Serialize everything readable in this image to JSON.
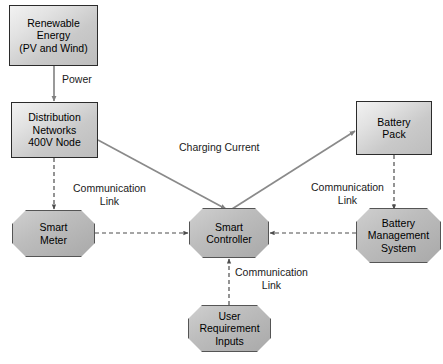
{
  "diagram": {
    "background_color": "#ffffff",
    "node_fill_rect": "#d9d9d9",
    "node_fill_octagon": "#b3b3b3",
    "line_color": "#808080",
    "dashed_line_color": "#555555",
    "nodes": [
      {
        "id": "renewable-energy",
        "shape": "rectangle",
        "lines": [
          "Renewable",
          "Energy",
          "(PV and Wind)"
        ],
        "x": 9,
        "y": 5,
        "w": 89,
        "h": 61
      },
      {
        "id": "distribution-networks",
        "shape": "rectangle",
        "lines": [
          "Distribution",
          "Networks",
          "400V Node"
        ],
        "x": 11,
        "y": 102,
        "w": 87,
        "h": 56
      },
      {
        "id": "battery-pack",
        "shape": "rectangle",
        "lines": [
          "Battery",
          "Pack"
        ],
        "x": 356,
        "y": 101,
        "w": 76,
        "h": 54
      },
      {
        "id": "smart-meter",
        "shape": "octagon",
        "lines": [
          "Smart",
          "Meter"
        ],
        "x": 12,
        "y": 210,
        "w": 83,
        "h": 47
      },
      {
        "id": "smart-controller",
        "shape": "octagon",
        "lines": [
          "Smart",
          "Controller"
        ],
        "x": 189,
        "y": 208,
        "w": 80,
        "h": 50
      },
      {
        "id": "battery-management-system",
        "shape": "octagon",
        "lines": [
          "Battery",
          "Management",
          "System"
        ],
        "x": 356,
        "y": 208,
        "w": 85,
        "h": 55
      },
      {
        "id": "user-requirement-inputs",
        "shape": "octagon",
        "lines": [
          "User",
          "Requirement",
          "Inputs"
        ],
        "x": 188,
        "y": 305,
        "w": 83,
        "h": 47
      }
    ],
    "edge_labels": [
      {
        "id": "power",
        "lines": [
          "Power"
        ],
        "x": 62,
        "y": 73,
        "w": 42,
        "align": "left"
      },
      {
        "id": "charging-current",
        "lines": [
          "Charging Current"
        ],
        "x": 179,
        "y": 141,
        "w": 95,
        "align": "left"
      },
      {
        "id": "communication-link-meter",
        "lines": [
          "Communication",
          "Link"
        ],
        "x": 62,
        "y": 182,
        "w": 95,
        "align": "center"
      },
      {
        "id": "communication-link-bms",
        "lines": [
          "Communication",
          "Link"
        ],
        "x": 300,
        "y": 181,
        "w": 95,
        "align": "center"
      },
      {
        "id": "communication-link-user",
        "lines": [
          "Communication",
          "Link"
        ],
        "x": 224,
        "y": 266,
        "w": 95,
        "align": "center"
      }
    ],
    "connections": [
      {
        "id": "renewable-to-distribution",
        "from": "renewable-energy",
        "to": "distribution-networks",
        "style": "solid",
        "label": "Power"
      },
      {
        "id": "distribution-to-controller",
        "from": "distribution-networks",
        "to": "smart-controller",
        "style": "solid",
        "label": ""
      },
      {
        "id": "controller-to-battery-pack",
        "from": "smart-controller",
        "to": "battery-pack",
        "style": "solid",
        "label": "Charging Current"
      },
      {
        "id": "distribution-to-meter",
        "from": "distribution-networks",
        "to": "smart-meter",
        "style": "dashed",
        "label": "Communication Link"
      },
      {
        "id": "meter-to-controller",
        "from": "smart-meter",
        "to": "smart-controller",
        "style": "dashed",
        "label": ""
      },
      {
        "id": "bms-to-controller",
        "from": "battery-management-system",
        "to": "smart-controller",
        "style": "dashed",
        "label": ""
      },
      {
        "id": "battery-pack-to-bms",
        "from": "battery-pack",
        "to": "battery-management-system",
        "style": "dashed",
        "label": "Communication Link"
      },
      {
        "id": "user-inputs-to-controller",
        "from": "user-requirement-inputs",
        "to": "smart-controller",
        "style": "dashed",
        "label": "Communication Link"
      }
    ]
  }
}
